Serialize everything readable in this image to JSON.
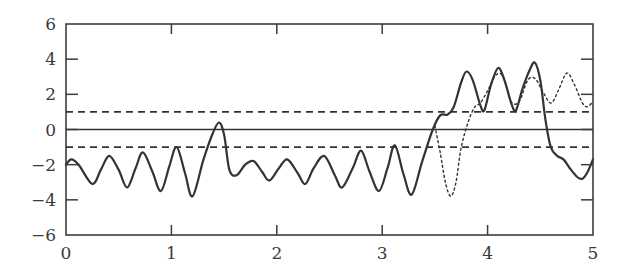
{
  "chart_data": {
    "type": "line",
    "title": "",
    "xlabel": "",
    "ylabel": "",
    "xlim": [
      0,
      5
    ],
    "ylim": [
      -6,
      6
    ],
    "x_ticks": [
      0,
      1,
      2,
      3,
      4,
      5
    ],
    "y_ticks": [
      -6,
      -4,
      -2,
      0,
      2,
      4,
      6
    ],
    "x_tick_labels": [
      "0",
      "1",
      "2",
      "3",
      "4",
      "5"
    ],
    "y_tick_labels": [
      "−6",
      "−4",
      "−2",
      "0",
      "2",
      "4",
      "6"
    ],
    "grid": false,
    "legend": null,
    "reference_lines": [
      {
        "name": "zero-line",
        "y": 0,
        "style": "solid"
      },
      {
        "name": "upper-threshold",
        "y": 1,
        "style": "dashed"
      },
      {
        "name": "lower-threshold",
        "y": -1,
        "style": "dashed"
      }
    ],
    "series": [
      {
        "name": "solid-signal",
        "style": "solid",
        "points": [
          [
            0.0,
            -2.0
          ],
          [
            0.05,
            -1.7
          ],
          [
            0.12,
            -2.0
          ],
          [
            0.25,
            -3.1
          ],
          [
            0.33,
            -2.3
          ],
          [
            0.41,
            -1.5
          ],
          [
            0.5,
            -2.3
          ],
          [
            0.58,
            -3.3
          ],
          [
            0.66,
            -2.2
          ],
          [
            0.73,
            -1.3
          ],
          [
            0.82,
            -2.4
          ],
          [
            0.9,
            -3.5
          ],
          [
            0.98,
            -2.1
          ],
          [
            1.05,
            -1.0
          ],
          [
            1.13,
            -2.5
          ],
          [
            1.2,
            -3.8
          ],
          [
            1.3,
            -1.8
          ],
          [
            1.38,
            -0.4
          ],
          [
            1.45,
            0.4
          ],
          [
            1.5,
            -0.3
          ],
          [
            1.55,
            -2.3
          ],
          [
            1.62,
            -2.6
          ],
          [
            1.7,
            -2.0
          ],
          [
            1.78,
            -1.8
          ],
          [
            1.86,
            -2.4
          ],
          [
            1.93,
            -2.9
          ],
          [
            2.02,
            -2.2
          ],
          [
            2.1,
            -1.7
          ],
          [
            2.2,
            -2.5
          ],
          [
            2.27,
            -3.1
          ],
          [
            2.35,
            -2.2
          ],
          [
            2.45,
            -1.5
          ],
          [
            2.55,
            -2.6
          ],
          [
            2.62,
            -3.3
          ],
          [
            2.72,
            -2.2
          ],
          [
            2.8,
            -1.2
          ],
          [
            2.88,
            -2.4
          ],
          [
            2.97,
            -3.5
          ],
          [
            3.05,
            -2.2
          ],
          [
            3.12,
            -0.9
          ],
          [
            3.2,
            -2.5
          ],
          [
            3.28,
            -3.7
          ],
          [
            3.38,
            -1.8
          ],
          [
            3.48,
            0.0
          ],
          [
            3.55,
            0.8
          ],
          [
            3.62,
            0.85
          ],
          [
            3.68,
            1.3
          ],
          [
            3.75,
            2.7
          ],
          [
            3.8,
            3.3
          ],
          [
            3.86,
            2.8
          ],
          [
            3.93,
            1.4
          ],
          [
            3.97,
            1.1
          ],
          [
            4.03,
            2.5
          ],
          [
            4.1,
            3.5
          ],
          [
            4.16,
            2.8
          ],
          [
            4.23,
            1.4
          ],
          [
            4.27,
            1.1
          ],
          [
            4.33,
            2.3
          ],
          [
            4.4,
            3.4
          ],
          [
            4.45,
            3.8
          ],
          [
            4.5,
            2.8
          ],
          [
            4.55,
            0.5
          ],
          [
            4.6,
            -1.0
          ],
          [
            4.66,
            -1.5
          ],
          [
            4.72,
            -1.7
          ],
          [
            4.78,
            -2.2
          ],
          [
            4.85,
            -2.7
          ],
          [
            4.9,
            -2.8
          ],
          [
            4.95,
            -2.4
          ],
          [
            5.0,
            -1.7
          ]
        ]
      },
      {
        "name": "dotted-signal",
        "style": "dotted",
        "points": [
          [
            3.5,
            0.2
          ],
          [
            3.55,
            -1.3
          ],
          [
            3.6,
            -3.0
          ],
          [
            3.65,
            -3.8
          ],
          [
            3.7,
            -3.0
          ],
          [
            3.75,
            -1.0
          ],
          [
            3.82,
            0.5
          ],
          [
            3.88,
            1.3
          ],
          [
            3.93,
            1.5
          ],
          [
            4.0,
            2.2
          ],
          [
            4.08,
            3.1
          ],
          [
            4.15,
            3.0
          ],
          [
            4.22,
            1.6
          ],
          [
            4.3,
            1.6
          ],
          [
            4.38,
            2.8
          ],
          [
            4.45,
            2.9
          ],
          [
            4.52,
            2.2
          ],
          [
            4.6,
            1.5
          ],
          [
            4.67,
            2.2
          ],
          [
            4.75,
            3.2
          ],
          [
            4.82,
            2.6
          ],
          [
            4.9,
            1.5
          ],
          [
            4.95,
            1.3
          ],
          [
            5.0,
            1.6
          ]
        ]
      }
    ]
  },
  "axes": {
    "color": "#3c3c3c",
    "line_color": "#333333",
    "background": "#ffffff"
  }
}
